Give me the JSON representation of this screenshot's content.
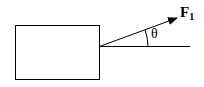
{
  "diagram": {
    "type": "force-diagram",
    "block": {
      "label": ""
    },
    "force": {
      "name": "F",
      "subscript": "1"
    },
    "angle": {
      "symbol": "θ"
    },
    "colors": {
      "stroke": "#000000",
      "background": "#ffffff"
    }
  }
}
